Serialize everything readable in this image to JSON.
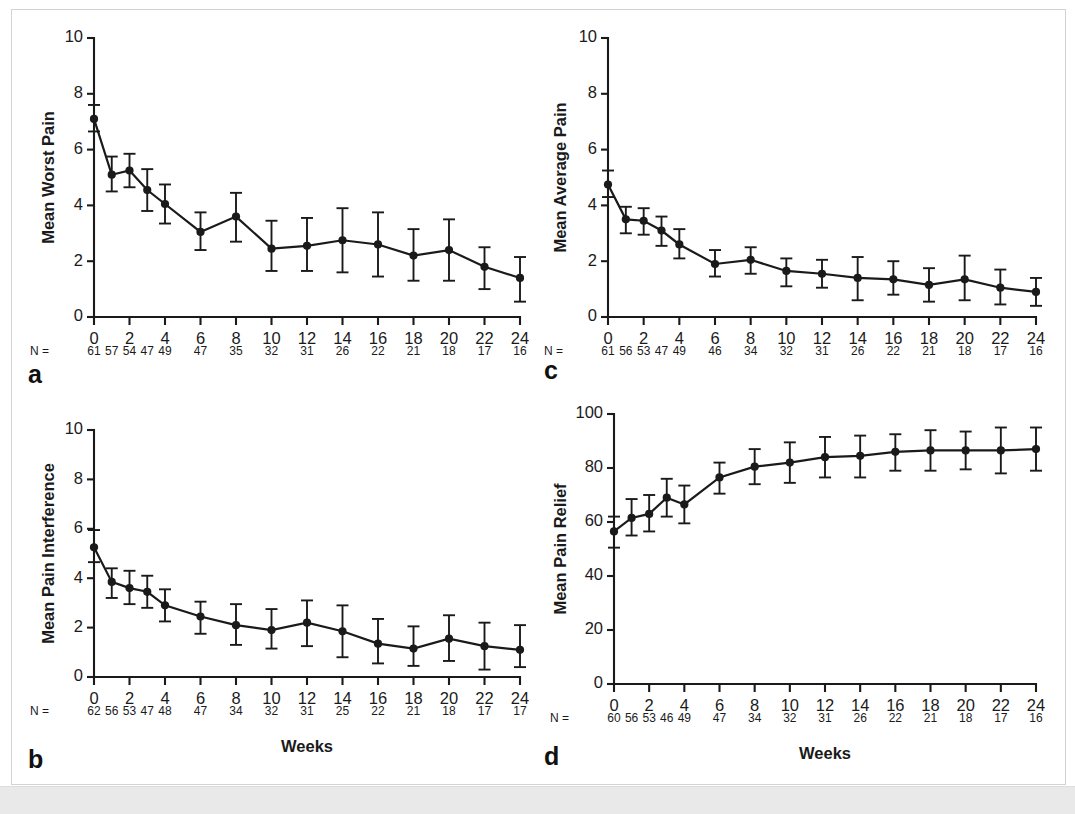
{
  "figure": {
    "panel_letters": {
      "a": "a",
      "b": "b",
      "c": "c",
      "d": "d"
    },
    "n_prefix": "N =",
    "x_axis_title": "Weeks",
    "colors": {
      "ink": "#1a1a1a",
      "frame": "#d3d3d3",
      "band": "#e9e9e9",
      "page": "#ffffff"
    }
  },
  "chart_data": [
    {
      "panel": "a",
      "type": "line",
      "title": "",
      "xlabel": "",
      "ylabel": "Mean Worst Pain",
      "xlim": [
        0,
        24
      ],
      "ylim": [
        0,
        10
      ],
      "xticks": [
        0,
        2,
        4,
        6,
        8,
        10,
        12,
        14,
        16,
        18,
        20,
        22,
        24
      ],
      "xtick_labels": [
        "0",
        "2",
        "4",
        "6",
        "8",
        "10",
        "12",
        "14",
        "16",
        "18",
        "20",
        "22",
        "24"
      ],
      "yticks": [
        0,
        2,
        4,
        6,
        8,
        10
      ],
      "ytick_labels": [
        "0",
        "2",
        "4",
        "6",
        "8",
        "10"
      ],
      "grid": false,
      "legend": "none",
      "x": [
        0,
        1,
        2,
        3,
        4,
        6,
        8,
        10,
        12,
        14,
        16,
        18,
        20,
        22,
        24
      ],
      "values": [
        7.1,
        5.1,
        5.25,
        4.55,
        4.05,
        3.05,
        3.6,
        2.45,
        2.55,
        2.75,
        2.6,
        2.2,
        2.4,
        1.8,
        1.4
      ],
      "err_low": [
        6.65,
        4.5,
        4.65,
        3.8,
        3.35,
        2.4,
        2.7,
        1.65,
        1.65,
        1.6,
        1.45,
        1.3,
        1.3,
        1.0,
        0.55
      ],
      "err_high": [
        7.6,
        5.75,
        5.85,
        5.3,
        4.75,
        3.75,
        4.45,
        3.45,
        3.55,
        3.9,
        3.75,
        3.15,
        3.5,
        2.5,
        2.15
      ],
      "n_values": [
        61,
        57,
        54,
        47,
        49,
        47,
        35,
        32,
        31,
        26,
        22,
        21,
        18,
        17,
        16
      ]
    },
    {
      "panel": "b",
      "type": "line",
      "title": "",
      "xlabel": "Weeks",
      "ylabel": "Mean Pain Interference",
      "xlim": [
        0,
        24
      ],
      "ylim": [
        0,
        10
      ],
      "xticks": [
        0,
        2,
        4,
        6,
        8,
        10,
        12,
        14,
        16,
        18,
        20,
        22,
        24
      ],
      "xtick_labels": [
        "0",
        "2",
        "4",
        "6",
        "8",
        "10",
        "12",
        "14",
        "16",
        "18",
        "20",
        "22",
        "24"
      ],
      "yticks": [
        0,
        2,
        4,
        6,
        8,
        10
      ],
      "ytick_labels": [
        "0",
        "2",
        "4",
        "6",
        "8",
        "10"
      ],
      "grid": false,
      "legend": "none",
      "x": [
        0,
        1,
        2,
        3,
        4,
        6,
        8,
        10,
        12,
        14,
        16,
        18,
        20,
        22,
        24
      ],
      "values": [
        5.25,
        3.85,
        3.6,
        3.45,
        2.9,
        2.45,
        2.1,
        1.9,
        2.2,
        1.85,
        1.35,
        1.15,
        1.55,
        1.25,
        1.1
      ],
      "err_low": [
        4.65,
        3.2,
        2.95,
        2.8,
        2.25,
        1.75,
        1.3,
        1.15,
        1.25,
        0.8,
        0.55,
        0.45,
        0.65,
        0.3,
        0.4
      ],
      "err_high": [
        5.95,
        4.4,
        4.3,
        4.1,
        3.55,
        3.05,
        2.95,
        2.75,
        3.1,
        2.9,
        2.35,
        2.05,
        2.5,
        2.2,
        2.1
      ],
      "n_values": [
        62,
        56,
        53,
        47,
        48,
        47,
        34,
        32,
        31,
        25,
        22,
        21,
        18,
        17,
        17
      ]
    },
    {
      "panel": "c",
      "type": "line",
      "title": "",
      "xlabel": "",
      "ylabel": "Mean Average Pain",
      "xlim": [
        0,
        24
      ],
      "ylim": [
        0,
        10
      ],
      "xticks": [
        0,
        2,
        4,
        6,
        8,
        10,
        12,
        14,
        16,
        18,
        20,
        22,
        24
      ],
      "xtick_labels": [
        "0",
        "2",
        "4",
        "6",
        "8",
        "10",
        "12",
        "14",
        "16",
        "18",
        "20",
        "22",
        "24"
      ],
      "yticks": [
        0,
        2,
        4,
        6,
        8,
        10
      ],
      "ytick_labels": [
        "0",
        "2",
        "4",
        "6",
        "8",
        "10"
      ],
      "grid": false,
      "legend": "none",
      "x": [
        0,
        1,
        2,
        3,
        4,
        6,
        8,
        10,
        12,
        14,
        16,
        18,
        20,
        22,
        24
      ],
      "values": [
        4.75,
        3.5,
        3.45,
        3.1,
        2.6,
        1.9,
        2.05,
        1.65,
        1.55,
        1.4,
        1.35,
        1.15,
        1.35,
        1.05,
        0.9
      ],
      "err_low": [
        4.3,
        3.0,
        2.95,
        2.55,
        2.1,
        1.45,
        1.55,
        1.1,
        1.05,
        0.6,
        0.8,
        0.55,
        0.6,
        0.45,
        0.4
      ],
      "err_high": [
        5.25,
        3.95,
        3.9,
        3.6,
        3.15,
        2.4,
        2.5,
        2.1,
        2.05,
        2.15,
        2.0,
        1.75,
        2.2,
        1.7,
        1.4
      ],
      "n_values": [
        61,
        56,
        53,
        47,
        49,
        46,
        34,
        32,
        31,
        26,
        22,
        21,
        18,
        17,
        16
      ]
    },
    {
      "panel": "d",
      "type": "line",
      "title": "",
      "xlabel": "Weeks",
      "ylabel": "Mean Pain Relief",
      "xlim": [
        0,
        24
      ],
      "ylim": [
        0,
        100
      ],
      "xticks": [
        0,
        2,
        4,
        6,
        8,
        10,
        12,
        14,
        16,
        18,
        20,
        22,
        24
      ],
      "xtick_labels": [
        "0",
        "2",
        "4",
        "6",
        "8",
        "10",
        "12",
        "14",
        "16",
        "18",
        "20",
        "22",
        "24"
      ],
      "yticks": [
        0,
        20,
        40,
        60,
        80,
        100
      ],
      "ytick_labels": [
        "0",
        "20",
        "40",
        "60",
        "80",
        "100"
      ],
      "grid": false,
      "legend": "none",
      "x": [
        0,
        1,
        2,
        3,
        4,
        6,
        8,
        10,
        12,
        14,
        16,
        18,
        20,
        22,
        24
      ],
      "values": [
        56.5,
        61.5,
        63.0,
        69.0,
        66.5,
        76.5,
        80.5,
        82.0,
        84.0,
        84.5,
        86.0,
        86.5,
        86.5,
        86.5,
        87.0
      ],
      "err_low": [
        50.5,
        55.0,
        56.5,
        62.0,
        59.5,
        70.5,
        74.0,
        74.5,
        76.5,
        76.5,
        79.0,
        79.0,
        79.5,
        78.0,
        79.0
      ],
      "err_high": [
        62.0,
        68.5,
        70.0,
        76.0,
        73.5,
        82.0,
        87.0,
        89.5,
        91.5,
        92.0,
        92.5,
        94.0,
        93.5,
        95.0,
        95.0
      ],
      "n_values": [
        60,
        56,
        53,
        46,
        49,
        47,
        34,
        32,
        31,
        26,
        22,
        21,
        18,
        17,
        16
      ]
    }
  ]
}
